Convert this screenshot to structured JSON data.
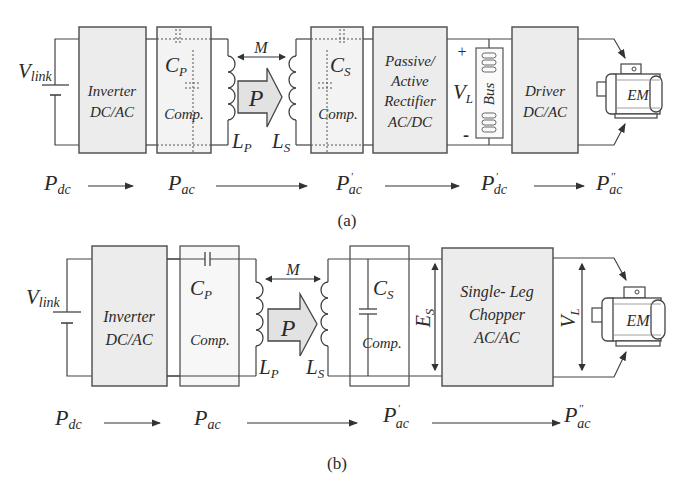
{
  "figure_a": {
    "caption": "(a)",
    "source_label": "V",
    "source_sub": "link",
    "blocks": {
      "inverter": [
        "Inverter",
        "DC/AC"
      ],
      "primary_comp": {
        "cap": "C",
        "cap_sub": "P",
        "label": "Comp."
      },
      "secondary_comp": {
        "cap": "C",
        "cap_sub": "S",
        "label": "Comp."
      },
      "rectifier": [
        "Passive/",
        "Active",
        "Rectifier",
        "AC/DC"
      ],
      "bus": {
        "label": "Bus",
        "voltage": "V",
        "voltage_sub": "L",
        "plus": "+",
        "minus": "-"
      },
      "driver": [
        "Driver",
        "DC/AC"
      ],
      "motor": "EM"
    },
    "coupling": {
      "mutual": "M",
      "power": "P",
      "lp": "L",
      "lp_sub": "P",
      "ls": "L",
      "ls_sub": "S"
    },
    "power_flow": [
      {
        "p": "P",
        "sub": "dc",
        "sup": ""
      },
      {
        "p": "P",
        "sub": "ac",
        "sup": ""
      },
      {
        "p": "P",
        "sub": "ac",
        "sup": "'"
      },
      {
        "p": "P",
        "sub": "dc",
        "sup": "'"
      },
      {
        "p": "P",
        "sub": "ac",
        "sup": "''"
      }
    ]
  },
  "figure_b": {
    "caption": "(b)",
    "source_label": "V",
    "source_sub": "link",
    "blocks": {
      "inverter": [
        "Inverter",
        "DC/AC"
      ],
      "primary_comp": {
        "cap": "C",
        "cap_sub": "P",
        "label": "Comp."
      },
      "secondary_comp": {
        "cap": "C",
        "cap_sub": "S",
        "label": "Comp."
      },
      "es": {
        "label": "E",
        "sub": "S"
      },
      "chopper": [
        "Single- Leg",
        "Chopper",
        "AC/AC"
      ],
      "vl": {
        "label": "V",
        "sub": "L"
      },
      "motor": "EM"
    },
    "coupling": {
      "mutual": "M",
      "power": "P",
      "lp": "L",
      "lp_sub": "P",
      "ls": "L",
      "ls_sub": "S"
    },
    "power_flow": [
      {
        "p": "P",
        "sub": "dc",
        "sup": ""
      },
      {
        "p": "P",
        "sub": "ac",
        "sup": ""
      },
      {
        "p": "P",
        "sub": "ac",
        "sup": "'"
      },
      {
        "p": "P",
        "sub": "ac",
        "sup": "''"
      }
    ]
  }
}
